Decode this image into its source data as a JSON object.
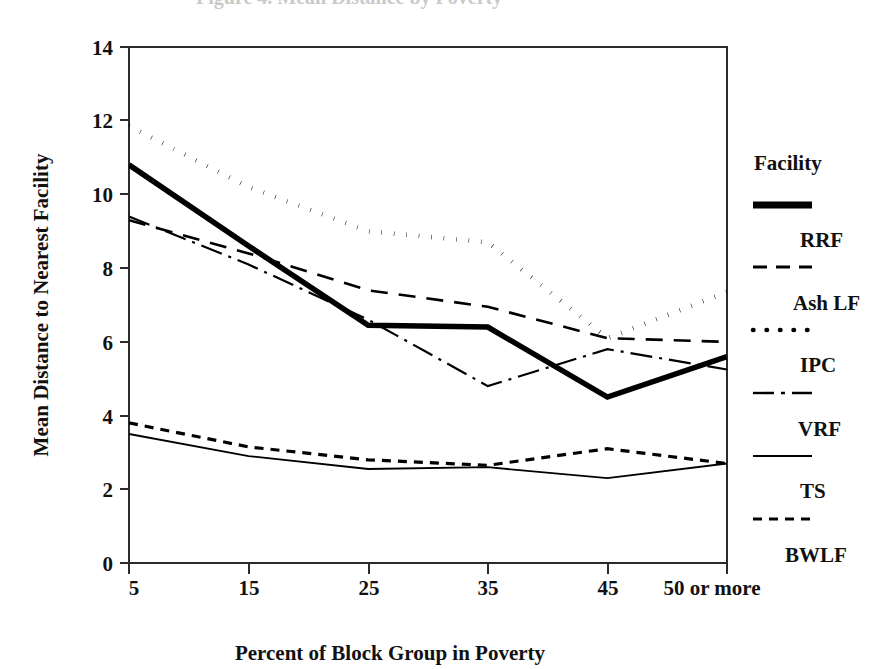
{
  "chart_data": {
    "type": "line",
    "title": "",
    "xlabel": "Percent of Block Group in Poverty",
    "ylabel": "Mean Distance to Nearest Facility",
    "categories": [
      "5",
      "15",
      "25",
      "35",
      "45",
      "50 or more"
    ],
    "xtick_labels": [
      "5",
      "15",
      "25",
      "35",
      "45",
      "50 or more"
    ],
    "ytick_labels": [
      "0",
      "2",
      "4",
      "6",
      "8",
      "10",
      "12",
      "14"
    ],
    "ylim": [
      0,
      14
    ],
    "ytick_step": 2,
    "grid": false,
    "legend_position": "right",
    "legend_title": "Facility",
    "series": [
      {
        "name": "RRF",
        "style": "thick-solid",
        "values": [
          10.8,
          8.6,
          6.45,
          6.4,
          4.5,
          5.6
        ]
      },
      {
        "name": "Ash LF",
        "style": "dashed",
        "values": [
          9.3,
          8.4,
          7.4,
          6.95,
          6.1,
          6.0
        ]
      },
      {
        "name": "IPC",
        "style": "dotted",
        "values": [
          11.85,
          10.2,
          9.0,
          8.7,
          6.1,
          7.35
        ]
      },
      {
        "name": "VRF",
        "style": "dash-dot",
        "values": [
          9.4,
          8.1,
          6.6,
          4.8,
          5.8,
          5.25
        ]
      },
      {
        "name": "TS",
        "style": "thin-solid",
        "values": [
          3.5,
          2.9,
          2.55,
          2.6,
          2.3,
          2.7
        ]
      },
      {
        "name": "BWLF",
        "style": "short-dashed",
        "values": [
          3.8,
          3.15,
          2.8,
          2.65,
          3.1,
          2.7
        ]
      }
    ]
  },
  "legend": {
    "title": "Facility",
    "entries": [
      {
        "label": "RRF",
        "style": "thick-solid"
      },
      {
        "label": "Ash LF",
        "style": "dashed"
      },
      {
        "label": "IPC",
        "style": "dotted"
      },
      {
        "label": "VRF",
        "style": "dash-dot"
      },
      {
        "label": "TS",
        "style": "thin-solid"
      },
      {
        "label": "BWLF",
        "style": "short-dashed"
      }
    ]
  },
  "axes": {
    "y_title": "Mean Distance to Nearest Facility",
    "x_title": "Percent of Block Group in Poverty",
    "y_ticks": [
      "14",
      "12",
      "10",
      "8",
      "6",
      "4",
      "2",
      "0"
    ],
    "x_ticks": [
      "5",
      "15",
      "25",
      "35",
      "45",
      "50 or more"
    ]
  },
  "colors": {
    "ink": "#000000",
    "frame": "#2b2b2b",
    "background": "#ffffff"
  },
  "artifacts": {
    "top_clipped_text": "Figure 4. Mean Distance by Poverty"
  }
}
